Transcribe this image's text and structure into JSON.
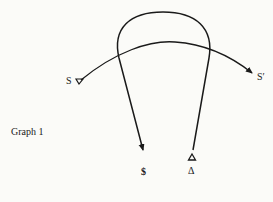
{
  "diagram": {
    "caption": "Graph 1",
    "labels": {
      "start_left": "S",
      "end_right": "S′",
      "bottom_left": "$",
      "bottom_right": "Δ"
    },
    "colors": {
      "ink": "#1a1a1a",
      "paper": "#fbfbf8"
    }
  }
}
